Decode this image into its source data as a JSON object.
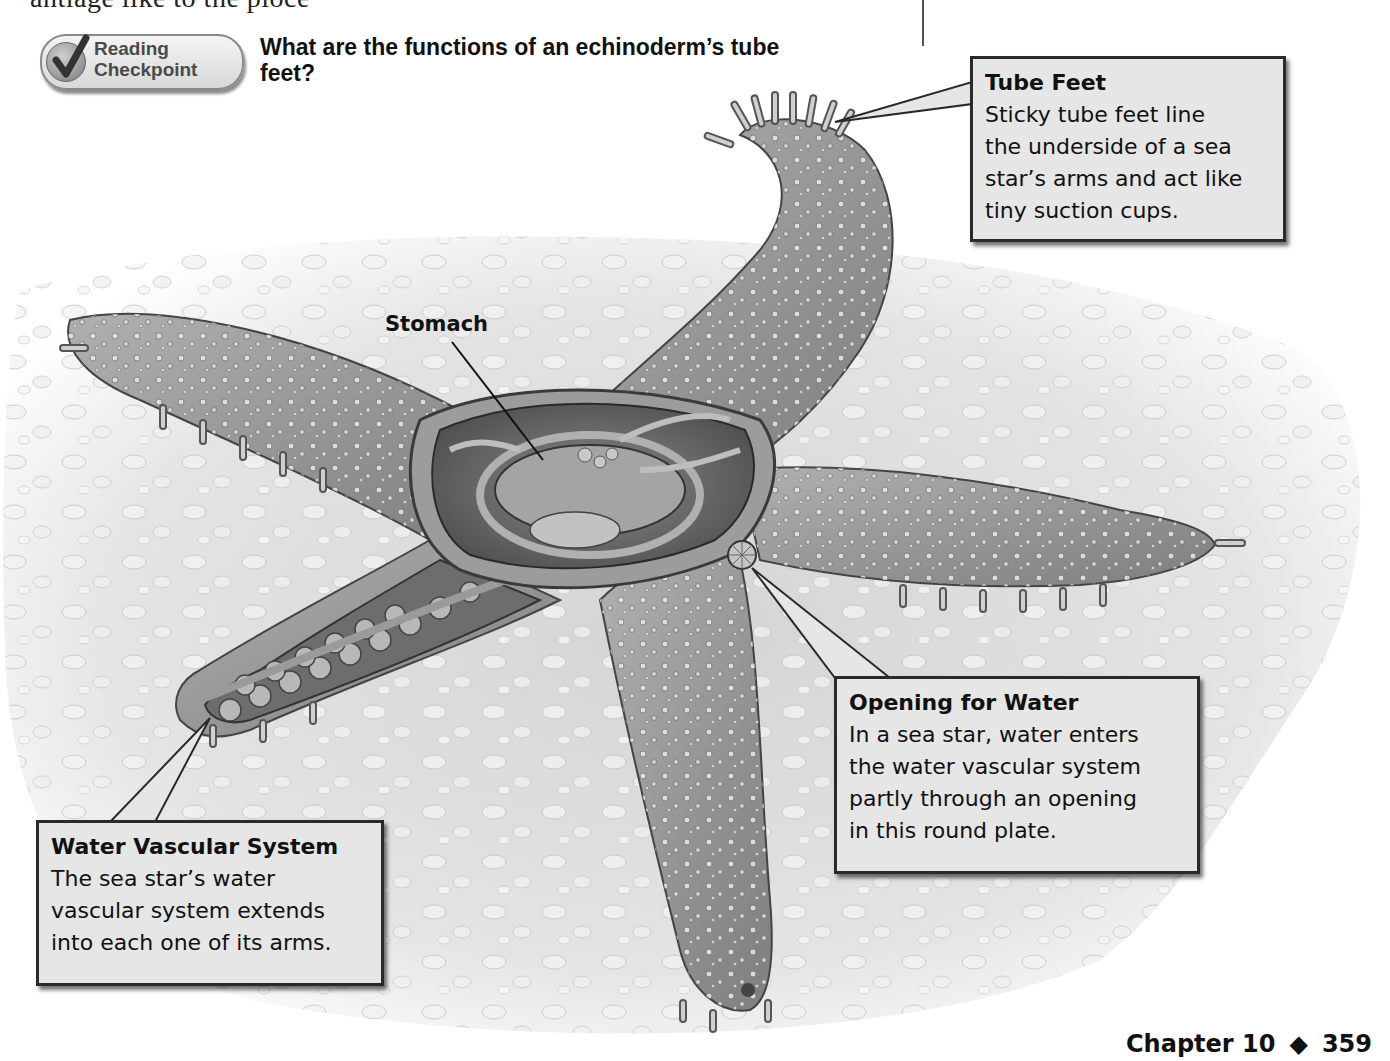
{
  "page": {
    "top_cut_text": "antlage like to the pioce",
    "reading_checkpoint": {
      "badge_line1": "Reading",
      "badge_line2": "Checkpoint",
      "question": "What are the functions of an echinoderm’s tube feet?"
    },
    "figure": {
      "subject": "sea star anatomy cutaway",
      "labels": {
        "stomach": "Stomach"
      },
      "callouts": [
        {
          "id": "tube-feet",
          "title": "Tube Feet",
          "text": "Sticky tube feet line\nthe underside of a sea\nstar’s arms and act like\ntiny suction cups."
        },
        {
          "id": "opening-for-water",
          "title": "Opening for Water",
          "text": "In a sea star, water enters\nthe water vascular system\npartly through an opening\nin this round plate."
        },
        {
          "id": "water-vascular-system",
          "title": "Water Vascular System",
          "text": "The sea star’s water\nvascular system extends\ninto each one of its arms."
        }
      ]
    },
    "footer": {
      "chapter": "Chapter 10",
      "separator": "◆",
      "page_number": "359"
    },
    "colors": {
      "callout_bg": "#e6e6e6",
      "callout_border": "#2a2a2a",
      "star_body": "#9a9a9a",
      "sand": "#e2e2e2"
    }
  }
}
